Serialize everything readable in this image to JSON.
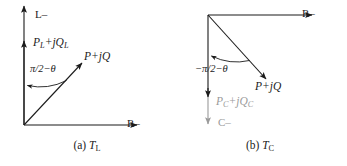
{
  "figure": {
    "background": "#ffffff",
    "stroke_color": "#1b1b1b",
    "faded_color": "#9a9a9a"
  },
  "panel_a": {
    "caption_prefix": "(a)",
    "caption_symbol": "T",
    "caption_subscript": "L",
    "axes": {
      "vertical_label": "L–",
      "horizontal_label": "R–"
    },
    "vectors": [
      {
        "name": "inductive-power",
        "label_main": "P",
        "label_sub1": "L",
        "label_op": "+j",
        "label_q": "Q",
        "label_sub2": "L",
        "direction": "up"
      },
      {
        "name": "complex-power",
        "label_main": "P",
        "label_op": "+j",
        "label_q": "Q",
        "direction": "up-right-45"
      }
    ],
    "angle_label": "π/2−θ"
  },
  "panel_b": {
    "caption_prefix": "(b)",
    "caption_symbol": "T",
    "caption_subscript": "C",
    "axes": {
      "vertical_label": "C–",
      "horizontal_label": "R–"
    },
    "vectors": [
      {
        "name": "capacitive-power",
        "label_main": "P",
        "label_sub1": "C",
        "label_op": "+j",
        "label_q": "Q",
        "label_sub2": "C",
        "direction": "down"
      },
      {
        "name": "complex-power",
        "label_main": "P",
        "label_op": "+j",
        "label_q": "Q",
        "direction": "down-right-45"
      }
    ],
    "angle_label": "−π/2−θ"
  }
}
